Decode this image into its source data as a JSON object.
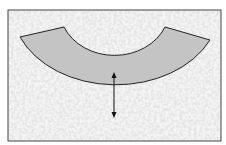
{
  "diagram": {
    "colors": {
      "background": "#ffffff",
      "speckle_base": "#eeeeee",
      "speckle_dark": "#c8c8c8",
      "band_fill": "#c4c4c4",
      "stroke": "#222222",
      "frame": "#444444"
    },
    "labels": []
  }
}
